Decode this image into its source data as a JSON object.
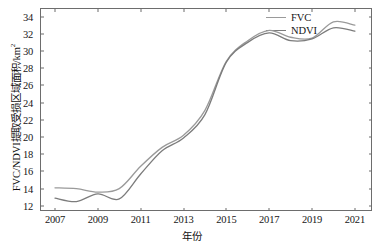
{
  "chart_data": {
    "type": "line",
    "title": "",
    "xlabel": "年份",
    "ylabel": "FVC/NDVI提取受损区域面积/km",
    "ylabel_superscript": "2",
    "xlim": [
      2006.3,
      2021.8
    ],
    "ylim": [
      11.4,
      35.0
    ],
    "xticks": [
      "2007",
      "2009",
      "2011",
      "2013",
      "2015",
      "2017",
      "2019",
      "2021"
    ],
    "xtick_values": [
      2007,
      2009,
      2011,
      2013,
      2015,
      2017,
      2019,
      2021
    ],
    "yticks": [
      "12",
      "14",
      "16",
      "18",
      "20",
      "22",
      "24",
      "26",
      "28",
      "30",
      "32",
      "34"
    ],
    "ytick_values": [
      12,
      14,
      16,
      18,
      20,
      22,
      24,
      26,
      28,
      30,
      32,
      34
    ],
    "grid": false,
    "legend_position": "top-right",
    "x": [
      2007,
      2008,
      2009,
      2010,
      2011,
      2012,
      2013,
      2014,
      2015,
      2016,
      2017,
      2018,
      2019,
      2020,
      2021
    ],
    "series": [
      {
        "name": "FVC",
        "color": "#9a9a9a",
        "values": [
          14.1,
          14.0,
          13.6,
          14.0,
          16.6,
          18.8,
          20.2,
          23.1,
          28.8,
          31.2,
          32.4,
          31.6,
          31.5,
          33.4,
          33.0
        ]
      },
      {
        "name": "NDVI",
        "color": "#7c7c7c",
        "values": [
          12.9,
          12.5,
          13.4,
          12.8,
          15.7,
          18.4,
          19.9,
          22.6,
          28.7,
          31.0,
          32.1,
          31.2,
          31.4,
          32.7,
          32.3
        ]
      }
    ]
  },
  "legend": {
    "entries": [
      {
        "label": "FVC",
        "color": "#9a9a9a"
      },
      {
        "label": "NDVI",
        "color": "#7c7c7c"
      }
    ]
  },
  "axes": {
    "x_title": "年份",
    "y_title": "FVC/NDVI提取受损区域面积/km",
    "y_title_sup": "2"
  },
  "caption": {
    "text": ""
  },
  "colors": {
    "frame": "#6d6d6d",
    "fvc_line": "#9a9a9a",
    "ndvi_line": "#7c7c7c",
    "text": "#161616",
    "background": "#ffffff"
  }
}
